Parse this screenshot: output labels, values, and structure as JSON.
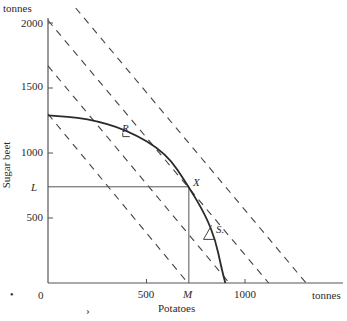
{
  "figure": {
    "y_unit": "tonnes",
    "x_unit": "tonnes",
    "y_title": "Sugar beet",
    "x_title": "Potatoes",
    "origin_label": "0",
    "x_ticks": [
      {
        "value": 500,
        "label": "500"
      },
      {
        "value": 1000,
        "label": "1000"
      }
    ],
    "y_ticks": [
      {
        "value": 500,
        "label": "500"
      },
      {
        "value": 1000,
        "label": "1000"
      },
      {
        "value": 1500,
        "label": "1500"
      },
      {
        "value": 2000,
        "label": "2000"
      }
    ],
    "point_labels": {
      "X": "X",
      "R": "R",
      "S": "S.",
      "L": "L",
      "M": "M"
    },
    "stray_marks": [
      "•",
      "›"
    ]
  },
  "chart_data": {
    "type": "line",
    "title": "",
    "xlabel": "Potatoes",
    "ylabel": "Sugar beet",
    "x_unit": "tonnes",
    "y_unit": "tonnes",
    "xlim": [
      0,
      1500
    ],
    "ylim": [
      0,
      2100
    ],
    "grid": false,
    "series": [
      {
        "name": "production-possibility-curve",
        "style": "solid",
        "points": [
          [
            0,
            1290
          ],
          [
            200,
            1265
          ],
          [
            400,
            1180
          ],
          [
            600,
            1000
          ],
          [
            715,
            740
          ],
          [
            800,
            520
          ],
          [
            850,
            330
          ],
          [
            880,
            120
          ],
          [
            900,
            0
          ]
        ]
      },
      {
        "name": "iso-value-line-1",
        "style": "dashed",
        "intercepts": {
          "x": 710,
          "y": 1300
        }
      },
      {
        "name": "iso-value-line-2",
        "style": "dashed",
        "intercepts": {
          "x": 920,
          "y": 1670
        }
      },
      {
        "name": "iso-value-line-3",
        "style": "dashed",
        "intercepts": {
          "x": 1120,
          "y": 2020
        }
      },
      {
        "name": "iso-value-line-4",
        "style": "dashed",
        "intercepts": {
          "x": 1310,
          "y": 2370
        }
      }
    ],
    "points": [
      {
        "label": "X",
        "x": 715,
        "y": 740
      },
      {
        "label": "R",
        "x": 410,
        "y": 1180
      },
      {
        "label": "S",
        "x": 840,
        "y": 420
      }
    ],
    "guides": [
      {
        "label": "L",
        "axis": "y",
        "value": 740
      },
      {
        "label": "M",
        "axis": "x",
        "value": 715
      }
    ]
  }
}
